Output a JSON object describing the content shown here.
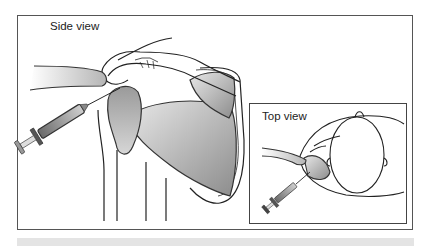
{
  "figure": {
    "panels": [
      {
        "id": "side",
        "label": "Side view"
      },
      {
        "id": "top",
        "label": "Top view"
      }
    ]
  },
  "colors": {
    "line": "#222222",
    "muscle_light": "#d8d8d8",
    "muscle_dark": "#8a8a8a",
    "frame": "#555555",
    "band": "#e4e4e4"
  }
}
